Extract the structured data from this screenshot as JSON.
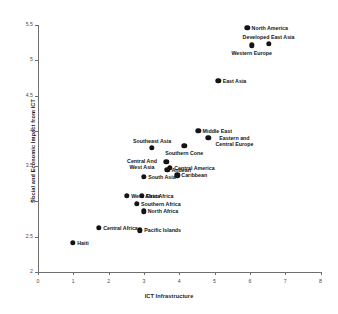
{
  "chart_data": {
    "type": "scatter",
    "title": "",
    "xlabel": "ICT Infrastructure",
    "ylabel": "Social and Economic Impact from ICT",
    "xlim": [
      0,
      8
    ],
    "ylim": [
      2,
      5.5
    ],
    "xticks": [
      "0",
      "1",
      "2",
      "3",
      "4",
      "5",
      "6",
      "7",
      "8"
    ],
    "yticks": [
      "2",
      "2.5",
      "3",
      "3.5",
      "4",
      "4.5",
      "5",
      "5.5"
    ],
    "grid": false,
    "legend": "none",
    "marker_color": "#141414",
    "points": [
      {
        "label": "North America",
        "x": 5.93,
        "y": 5.46,
        "label_pos": "right"
      },
      {
        "label": "Developed East Asia",
        "x": 6.53,
        "y": 5.23,
        "label_pos": "above"
      },
      {
        "label": "Western Europe",
        "x": 6.05,
        "y": 5.21,
        "label_pos": "below"
      },
      {
        "label": "East Asia",
        "x": 5.11,
        "y": 4.71,
        "label_pos": "right"
      },
      {
        "label": "Middle East",
        "x": 4.54,
        "y": 4.0,
        "label_pos": "right"
      },
      {
        "label": "Eastern and Central Europe",
        "x": 4.82,
        "y": 3.9,
        "label_pos": "right"
      },
      {
        "label": "Southeast Asia",
        "x": 3.23,
        "y": 3.76,
        "label_pos": "above"
      },
      {
        "label": "Southern Cone",
        "x": 4.14,
        "y": 3.79,
        "label_pos": "below"
      },
      {
        "label": "Central And West Asia",
        "x": 3.63,
        "y": 3.56,
        "label_pos": "left"
      },
      {
        "label": "Central America",
        "x": 3.74,
        "y": 3.48,
        "label_pos": "right"
      },
      {
        "label": "Andean",
        "x": 3.66,
        "y": 3.45,
        "label_pos": "right"
      },
      {
        "label": "Caribbean",
        "x": 3.94,
        "y": 3.37,
        "label_pos": "right"
      },
      {
        "label": "South Asia",
        "x": 3.0,
        "y": 3.35,
        "label_pos": "right"
      },
      {
        "label": "West Africa",
        "x": 2.52,
        "y": 3.08,
        "label_pos": "right"
      },
      {
        "label": "East Africa",
        "x": 2.94,
        "y": 3.08,
        "label_pos": "right"
      },
      {
        "label": "Southern Africa",
        "x": 2.8,
        "y": 2.97,
        "label_pos": "right"
      },
      {
        "label": "North Africa",
        "x": 2.99,
        "y": 2.86,
        "label_pos": "right"
      },
      {
        "label": "Central Africa",
        "x": 1.73,
        "y": 2.63,
        "label_pos": "right"
      },
      {
        "label": "Pacific Islands",
        "x": 2.89,
        "y": 2.59,
        "label_pos": "right"
      },
      {
        "label": "Haiti",
        "x": 0.99,
        "y": 2.41,
        "label_pos": "right"
      }
    ]
  }
}
